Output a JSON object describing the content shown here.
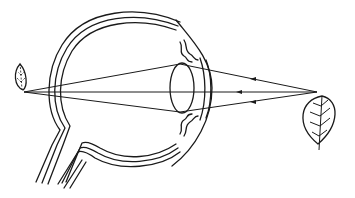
{
  "diagram": {
    "title": "",
    "colors": {
      "line": "#1a1a1a",
      "background": "#ffffff"
    },
    "elements": {
      "eyeball": {
        "label": "",
        "layers": 3
      },
      "cornea": {
        "label": ""
      },
      "lens": {
        "label": ""
      },
      "iris": {
        "label": ""
      },
      "optic_nerve": {
        "label": ""
      },
      "object": {
        "label": "",
        "kind": "leaf",
        "orientation": "upright (stem down)"
      },
      "retinal_image": {
        "label": "",
        "kind": "leaf",
        "orientation": "inverted, reduced"
      }
    },
    "rays": {
      "count": 3,
      "direction": "right-to-left",
      "converge_at": "retina"
    }
  }
}
